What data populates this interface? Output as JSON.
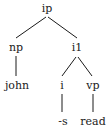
{
  "tree": {
    "root": "ip",
    "nodes": {
      "ip": {
        "label": "ip",
        "x": 47,
        "y": 3
      },
      "np": {
        "label": "np",
        "x": 16,
        "y": 42
      },
      "i1": {
        "label": "i1",
        "x": 77,
        "y": 42
      },
      "john": {
        "label": "john",
        "x": 17,
        "y": 80
      },
      "i": {
        "label": "i",
        "x": 62,
        "y": 80
      },
      "vp": {
        "label": "vp",
        "x": 93,
        "y": 80
      },
      "s": {
        "label": "-s",
        "x": 63,
        "y": 116
      },
      "read": {
        "label": "read",
        "x": 93,
        "y": 116
      }
    },
    "edges": [
      {
        "from": "ip",
        "to": "np"
      },
      {
        "from": "ip",
        "to": "i1"
      },
      {
        "from": "np",
        "to": "john"
      },
      {
        "from": "i1",
        "to": "i"
      },
      {
        "from": "i1",
        "to": "vp"
      },
      {
        "from": "i",
        "to": "-s"
      },
      {
        "from": "vp",
        "to": "read"
      }
    ]
  },
  "colors": {
    "line": "#1a1a1a",
    "text": "#1a1a1a",
    "background": "#ffffff"
  }
}
